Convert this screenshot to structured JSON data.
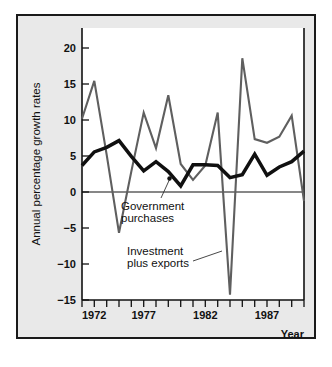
{
  "figure": {
    "background_color": "#e9e9e9",
    "plot_background_color": "#ffffff",
    "frame_color": "#1a1a1a"
  },
  "labels": {
    "y_axis_title": "Annual percentage growth rates",
    "x_axis_title": "Year",
    "annotation_government": "Government",
    "annotation_purchases": "purchases",
    "annotation_investment": "Investment",
    "annotation_plus_exports": "plus exports"
  },
  "axis": {
    "y_ticks": [
      "20",
      "15",
      "10",
      "5",
      "0",
      "−5",
      "−10",
      "−15"
    ],
    "y_tick_values": [
      20,
      15,
      10,
      5,
      0,
      -5,
      -10,
      -15
    ],
    "x_ticks": [
      "1972",
      "1977",
      "1982",
      "1987"
    ],
    "x_tick_values": [
      1972,
      1977,
      1982,
      1987
    ]
  },
  "chart_data": {
    "type": "line",
    "title": "",
    "xlabel": "Year",
    "ylabel": "Annual percentage growth rates",
    "xlim": [
      1972,
      1990
    ],
    "ylim": [
      -15,
      21
    ],
    "grid": false,
    "legend": "inline-annotations",
    "x": [
      1972,
      1973,
      1974,
      1975,
      1976,
      1977,
      1978,
      1979,
      1980,
      1981,
      1982,
      1983,
      1984,
      1985,
      1986,
      1987,
      1988,
      1989,
      1990
    ],
    "series": [
      {
        "name": "Investment plus exports",
        "color": "#5f5f5f",
        "line_width": "thin",
        "values": [
          9.0,
          14.0,
          4.2,
          -6.1,
          2.0,
          9.8,
          5.1,
          12.1,
          3.0,
          0.9,
          2.8,
          9.8,
          -14.3,
          17.0,
          6.3,
          5.8,
          6.6,
          9.4,
          -1.9
        ]
      },
      {
        "name": "Government purchases",
        "color": "#101010",
        "line_width": "thick",
        "values": [
          2.8,
          4.6,
          5.2,
          6.1,
          4.0,
          2.1,
          3.3,
          2.0,
          0.1,
          2.9,
          2.9,
          2.8,
          1.2,
          1.6,
          4.3,
          1.5,
          2.6,
          3.3,
          4.7
        ]
      }
    ]
  }
}
